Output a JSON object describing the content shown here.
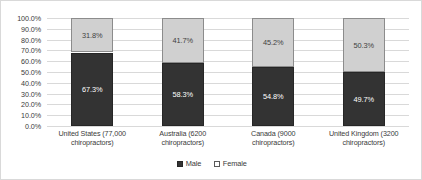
{
  "chart_data": {
    "type": "bar",
    "subtype": "100% stacked column",
    "title": "",
    "xlabel": "",
    "ylabel": "",
    "ylim": [
      0,
      100
    ],
    "ytick_labels": [
      "100.0%",
      "90.0%",
      "80.0%",
      "70.0%",
      "60.0%",
      "50.0%",
      "40.0%",
      "30.0%",
      "20.0%",
      "10.0%",
      "0.0%"
    ],
    "ytick_values": [
      100,
      90,
      80,
      70,
      60,
      50,
      40,
      30,
      20,
      10,
      0
    ],
    "grid": true,
    "legend_position": "bottom-center",
    "categories": [
      "United States (77,000 chiropractors)",
      "Australia (6200 chiropractors)",
      "Canada (9000 chiropractors)",
      "United Kingdom (3200 chiropractors)"
    ],
    "series": [
      {
        "name": "Male",
        "color": "#333333",
        "values": [
          67.3,
          58.3,
          54.8,
          49.7
        ],
        "labels": [
          "67.3%",
          "58.3%",
          "54.8%",
          "49.7%"
        ]
      },
      {
        "name": "Female",
        "color": "#d0d0d0",
        "values": [
          31.8,
          41.7,
          45.2,
          50.3
        ],
        "labels": [
          "31.8%",
          "41.7%",
          "45.2%",
          "50.3%"
        ]
      }
    ]
  }
}
